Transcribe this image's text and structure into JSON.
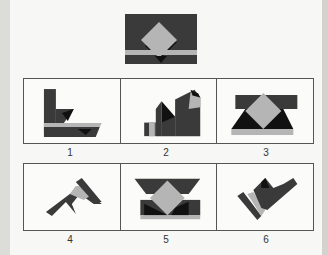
{
  "puzzle": {
    "target_figure": {
      "description": "dark rectangle with gray diamond, black shadow triangles and gray horizontal band"
    },
    "options": [
      {
        "label": "1"
      },
      {
        "label": "2"
      },
      {
        "label": "3"
      },
      {
        "label": "4"
      },
      {
        "label": "5"
      },
      {
        "label": "6"
      }
    ],
    "colors": {
      "dark": "#3a3a3a",
      "black": "#111111",
      "gray": "#b5b5b5",
      "background": "#f7f7f5",
      "border": "#555555"
    }
  }
}
